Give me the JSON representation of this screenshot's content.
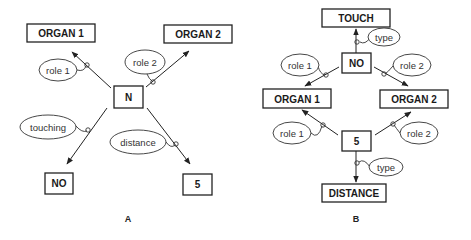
{
  "diagram_a": {
    "panel_label": "A",
    "center_node": "N",
    "nodes": {
      "organ1": "ORGAN 1",
      "organ2": "ORGAN 2",
      "no": "NO",
      "five": "5"
    },
    "edge_labels": {
      "role1": "role 1",
      "role2": "role 2",
      "touching": "touching",
      "distance": "distance"
    },
    "edges": [
      {
        "from": "N",
        "to": "ORGAN 1",
        "label": "role 1"
      },
      {
        "from": "N",
        "to": "ORGAN 2",
        "label": "role 2"
      },
      {
        "from": "N",
        "to": "NO",
        "label": "touching"
      },
      {
        "from": "N",
        "to": "5",
        "label": "distance"
      }
    ]
  },
  "diagram_b": {
    "panel_label": "B",
    "nodes": {
      "touch": "TOUCH",
      "no": "NO",
      "organ1": "ORGAN 1",
      "organ2": "ORGAN 2",
      "five": "5",
      "distance": "DISTANCE"
    },
    "edge_labels": {
      "type_top": "type",
      "role1_top": "role 1",
      "role2_top": "role 2",
      "role1_bottom": "role 1",
      "role2_bottom": "role 2",
      "type_bottom": "type"
    },
    "edges": [
      {
        "from": "NO",
        "to": "TOUCH",
        "label": "type"
      },
      {
        "from": "NO",
        "to": "ORGAN 1",
        "label": "role 1"
      },
      {
        "from": "NO",
        "to": "ORGAN 2",
        "label": "role 2"
      },
      {
        "from": "5",
        "to": "ORGAN 1",
        "label": "role 1"
      },
      {
        "from": "5",
        "to": "ORGAN 2",
        "label": "role 2"
      },
      {
        "from": "5",
        "to": "DISTANCE",
        "label": "type"
      }
    ]
  }
}
